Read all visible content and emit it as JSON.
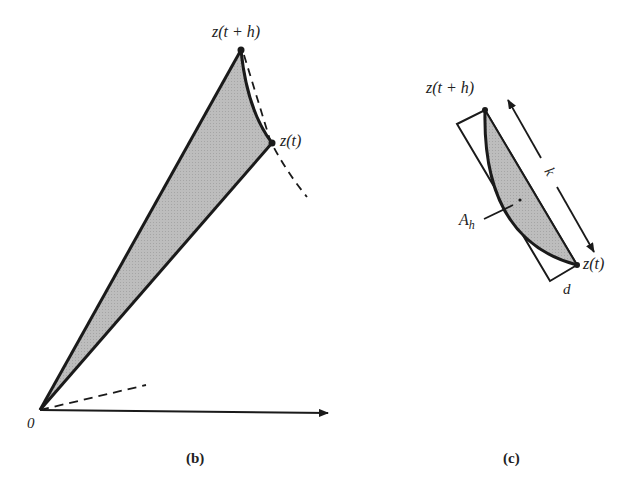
{
  "figure": {
    "panel_b": {
      "caption": "(b)",
      "labels": {
        "z_t_plus_h": "z(t + h)",
        "z_t": "z(t)",
        "origin": "0"
      }
    },
    "panel_c": {
      "caption": "(c)",
      "labels": {
        "z_t_plus_h": "z(t + h)",
        "z_t": "z(t)",
        "area": "A",
        "area_subscript": "h",
        "length": "k",
        "width": "d"
      }
    },
    "colors": {
      "line": "#1a1a1a",
      "fill": "#b8b8b8",
      "background": "#ffffff"
    }
  }
}
